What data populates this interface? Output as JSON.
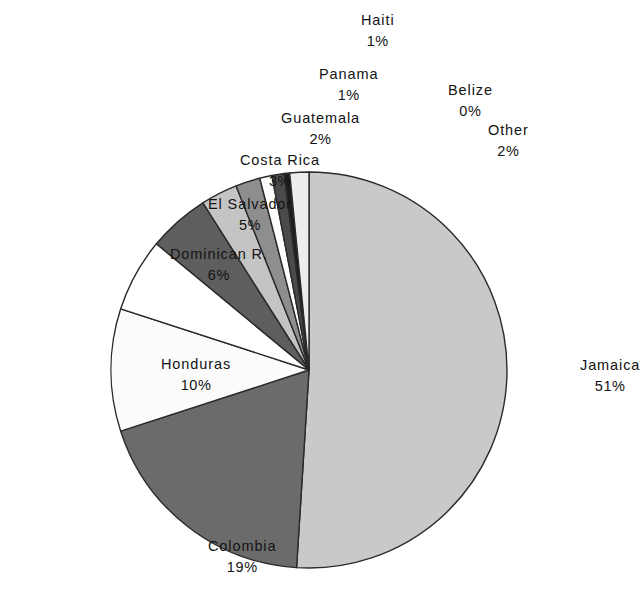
{
  "chart_data": {
    "type": "pie",
    "title": "",
    "subtitle": "",
    "xlabel": "",
    "ylabel": "",
    "legend_position": "none",
    "grid": false,
    "value_unit": "%",
    "total": 100,
    "categories": [
      "Jamaica",
      "Colombia",
      "Honduras",
      "Dominican R.",
      "El Salvador",
      "Costa Rica",
      "Guatemala",
      "Panama",
      "Haiti",
      "Belize",
      "Other"
    ],
    "values": [
      51,
      19,
      10,
      6,
      5,
      3,
      2,
      1,
      1,
      0,
      2
    ],
    "slices": [
      {
        "label": "Jamaica",
        "value": 51,
        "value_text": "51%",
        "fill": "#c9c9c9",
        "start_deg": 0.0,
        "end_deg": 183.6
      },
      {
        "label": "Colombia",
        "value": 19,
        "value_text": "19%",
        "fill": "#6b6b6b",
        "start_deg": 183.6,
        "end_deg": 252.0
      },
      {
        "label": "Honduras",
        "value": 10,
        "value_text": "10%",
        "fill": "#fbfbfb",
        "start_deg": 252.0,
        "end_deg": 288.0
      },
      {
        "label": "Dominican R.",
        "value": 6,
        "value_text": "6%",
        "fill": "#ffffff",
        "start_deg": 288.0,
        "end_deg": 309.6
      },
      {
        "label": "El Salvador",
        "value": 5,
        "value_text": "5%",
        "fill": "#5e5e5e",
        "start_deg": 309.6,
        "end_deg": 327.6
      },
      {
        "label": "Costa Rica",
        "value": 3,
        "value_text": "3%",
        "fill": "#c4c4c4",
        "start_deg": 327.6,
        "end_deg": 338.4
      },
      {
        "label": "Guatemala",
        "value": 2,
        "value_text": "2%",
        "fill": "#8e8e8e",
        "start_deg": 338.4,
        "end_deg": 345.6
      },
      {
        "label": "Panama",
        "value": 1,
        "value_text": "1%",
        "fill": "#fdfdfd",
        "start_deg": 345.6,
        "end_deg": 349.2
      },
      {
        "label": "Haiti",
        "value": 1,
        "value_text": "1%",
        "fill": "#4a4a4a",
        "start_deg": 349.2,
        "end_deg": 352.8
      },
      {
        "label": "Belize",
        "value": 0,
        "value_text": "0%",
        "fill": "#1e1e1e",
        "start_deg": 352.8,
        "end_deg": 354.4
      },
      {
        "label": "Other",
        "value": 2,
        "value_text": "2%",
        "fill": "#ededed",
        "start_deg": 354.4,
        "end_deg": 360.0
      }
    ],
    "geometry": {
      "cx": 309,
      "cy": 370,
      "r": 198,
      "start_angle_deg": 0,
      "direction": "clockwise"
    }
  },
  "labels": [
    {
      "name": "Haiti",
      "value_text": "1%",
      "x": 378,
      "y": 10,
      "align": "center"
    },
    {
      "name": "Panama",
      "value_text": "1%",
      "x": 348,
      "y": 64,
      "align": "center"
    },
    {
      "name": "Belize",
      "value_text": "0%",
      "x": 470,
      "y": 80,
      "align": "center"
    },
    {
      "name": "Guatemala",
      "value_text": "2%",
      "x": 320,
      "y": 108,
      "align": "center"
    },
    {
      "name": "Other",
      "value_text": "2%",
      "x": 508,
      "y": 120,
      "align": "center"
    },
    {
      "name": "Costa Rica",
      "value_text": "3%",
      "x": 280,
      "y": 150,
      "align": "center"
    },
    {
      "name": "El Salvador",
      "value_text": "5%",
      "x": 250,
      "y": 194,
      "align": "center"
    },
    {
      "name": "Dominican R.",
      "value_text": "6%",
      "x": 219,
      "y": 244,
      "align": "center"
    },
    {
      "name": "Honduras",
      "value_text": "10%",
      "x": 196,
      "y": 354,
      "align": "center"
    },
    {
      "name": "Colombia",
      "value_text": "19%",
      "x": 242,
      "y": 536,
      "align": "center"
    },
    {
      "name": "Jamaica",
      "value_text": "51%",
      "x": 610,
      "y": 355,
      "align": "center"
    }
  ]
}
